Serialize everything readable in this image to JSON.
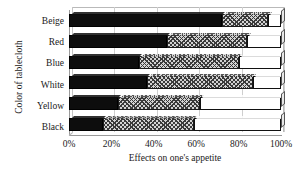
{
  "chart_data": {
    "type": "bar",
    "orientation": "horizontal",
    "stacked": true,
    "stack_mode": "percent",
    "title": "",
    "xlabel": "Effects on one's appetite",
    "ylabel": "Color of tablecloth",
    "categories": [
      "Beige",
      "Red",
      "Blue",
      "White",
      "Yellow",
      "Black"
    ],
    "xlim": [
      0,
      100
    ],
    "xticks": [
      0,
      20,
      40,
      60,
      80,
      100
    ],
    "xtick_labels": [
      "0%",
      "20%",
      "40%",
      "60%",
      "80%",
      "100%"
    ],
    "grid": true,
    "legend": "none",
    "series": [
      {
        "name": "Increases appetite",
        "fill": "solid-black",
        "color": "#0d0d0d",
        "values": [
          72,
          46,
          33,
          37,
          23,
          16
        ]
      },
      {
        "name": "No effect",
        "fill": "crosshatch",
        "color": "#d3d3d3",
        "values": [
          22,
          38,
          47,
          50,
          39,
          43
        ]
      },
      {
        "name": "Decreases appetite",
        "fill": "solid-white",
        "color": "#ffffff",
        "values": [
          6,
          16,
          20,
          13,
          38,
          41
        ]
      }
    ]
  },
  "axes": {
    "y_title": "Color of tablecloth",
    "x_title": "Effects on one's appetite",
    "x_tick_labels": [
      "0%",
      "20%",
      "40%",
      "60%",
      "80%",
      "100%"
    ],
    "y_tick_labels": [
      "Beige",
      "Red",
      "Blue",
      "White",
      "Yellow",
      "Black"
    ]
  }
}
